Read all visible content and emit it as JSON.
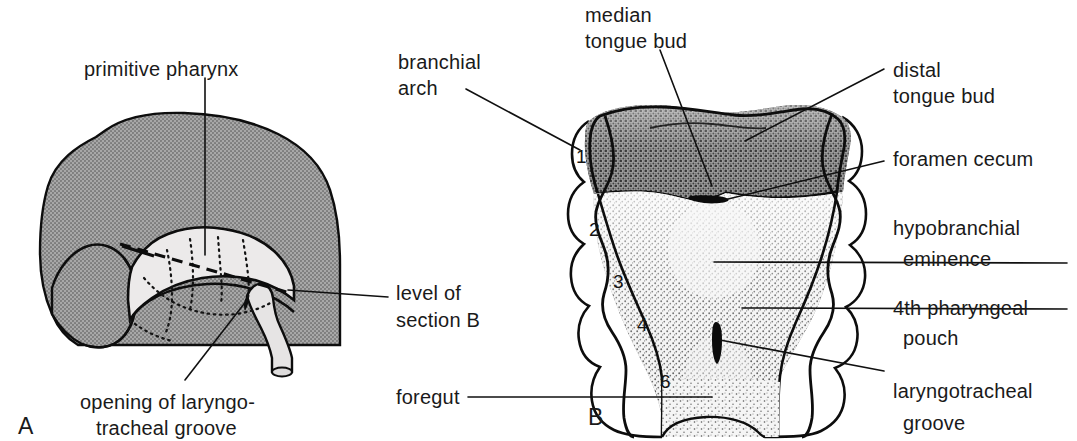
{
  "figure": {
    "background_color": "#ffffff",
    "ink_color": "#101010",
    "tissue_gray": "#9c9c9c",
    "tissue_light": "#e8e8e8",
    "stipple_dark": "#8a8a8a",
    "stipple_light": "#f0f0f0"
  },
  "panel_a": {
    "letter": "A",
    "labels": {
      "primitive_pharynx": "primitive pharynx",
      "level_of_section_b_line1": "level of",
      "level_of_section_b_line2": "section B",
      "opening_line1": "opening of laryngo-",
      "opening_line2": "tracheal groove"
    }
  },
  "panel_b": {
    "letter": "B",
    "labels": {
      "branchial_arch_line1": "branchial",
      "branchial_arch_line2": "arch",
      "median_tongue_bud_line1": "median",
      "median_tongue_bud_line2": "tongue bud",
      "distal_tongue_bud_line1": "distal",
      "distal_tongue_bud_line2": "tongue bud",
      "foramen_cecum": "foramen cecum",
      "hypobranchial_eminence_line1": "hypobranchial",
      "hypobranchial_eminence_line2": "eminence",
      "fourth_pharyngeal_pouch_line1": "4th pharyngeal",
      "fourth_pharyngeal_pouch_line2": "pouch",
      "laryngotracheal_groove_line1": "laryngotracheal",
      "laryngotracheal_groove_line2": "groove",
      "foregut": "foregut"
    },
    "arch_numbers": [
      "1",
      "2",
      "3",
      "4",
      "6"
    ]
  }
}
